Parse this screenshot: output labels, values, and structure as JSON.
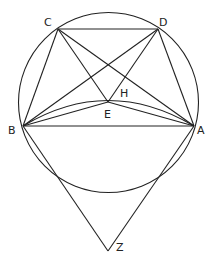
{
  "diagram": {
    "type": "geometry",
    "stroke_color": "#222222",
    "circle": {
      "cx": 108.5,
      "cy": 102.5,
      "r": 90
    },
    "points": {
      "A": {
        "x": 194,
        "y": 126,
        "label": "A"
      },
      "B": {
        "x": 23,
        "y": 126,
        "label": "B"
      },
      "C": {
        "x": 58,
        "y": 29,
        "label": "C"
      },
      "D": {
        "x": 158,
        "y": 29,
        "label": "D"
      },
      "E": {
        "x": 108,
        "y": 102,
        "label": "E"
      },
      "H": {
        "label": "H"
      },
      "Z": {
        "x": 108,
        "y": 251,
        "label": "Z"
      }
    },
    "segments": [
      "CD",
      "CB",
      "CA",
      "CE",
      "DB",
      "DA",
      "DE",
      "BA",
      "BE",
      "AE",
      "BZ",
      "AZ"
    ],
    "arcs": [
      "arc BA through near E (upper)"
    ]
  }
}
